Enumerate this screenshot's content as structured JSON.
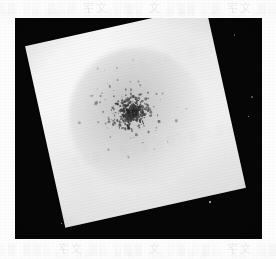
{
  "page": {
    "kind": "scanned-page-figure",
    "background_color": "#fdfdfd",
    "width": 276,
    "height": 259
  },
  "bleed_through_text": {
    "note": "faint show-through text from the reverse side of the printed page, mirrored and illegible",
    "top_line_1": "░▒ 文字 ▒░ ▒▒░ 文 ░▒░ 文字 ▒░▒ ░░ ▒░▒ 文字░ ▒░",
    "top_line_2": "░░▒ ▒░ ░▒▒ ░▒ ▒░░ ▒▒ ░▒░ ▒░ ░▒▒ ▒░ ░▒",
    "bottom_line_1": "▒░ 文字 ░▒░ ▒░ 文 ▒▒░ ░▒ 文字 ░▒▒ ▒░ ░▒░",
    "bottom_line_2": "░▒░ ▒▒ ░░▒ ▒░ ░▒▒ ░▒ ▒░░ ▒▒ ░▒░",
    "left_margin": "░▒░ ▒░▒ ░▒",
    "on_plate_1": "░▒░ ▒░▒░ ▒░▒ ░▒░▒",
    "on_plate_2": "▒░▒ ░▒░ ▒░"
  },
  "photograph": {
    "description": "black-and-white photograph of a tilted square white plate on a black background, densely covered with small dark speckled colonies",
    "frame": {
      "left": 15,
      "top": 18,
      "width": 247,
      "height": 221
    },
    "background_color": "#060606",
    "plate": {
      "shape": "square",
      "rotation_degrees": -12.5,
      "surface_color": "#f2f2f2",
      "corners_px": [
        [
          200,
          18
        ],
        [
          245,
          145
        ],
        [
          112,
          239
        ],
        [
          35,
          95
        ]
      ]
    },
    "colony_cluster": {
      "description": "roughly circular dense cluster of fine dark granules near the centre of the plate",
      "center_px": [
        130,
        118
      ],
      "approx_diameter_px": 140,
      "granule_count": 520,
      "core_density": "high",
      "edge_density": "sparse scattered outliers"
    },
    "background_specks": {
      "description": "small bright dust specks over the dark field",
      "count": 22
    }
  }
}
